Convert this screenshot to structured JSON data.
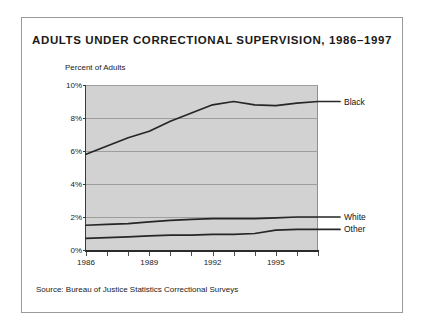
{
  "chart_data": {
    "type": "line",
    "title": "ADULTS UNDER CORRECTIONAL SUPERVISION, 1986–1997",
    "xlabel": "",
    "ylabel": "Percent of Adults",
    "ylim": [
      0,
      10
    ],
    "xlim": [
      1986,
      1997
    ],
    "grid": true,
    "legend_position": "right-inline-labels",
    "y_ticks": [
      {
        "value": 0,
        "label": "0%"
      },
      {
        "value": 2,
        "label": "2%"
      },
      {
        "value": 4,
        "label": "4%"
      },
      {
        "value": 6,
        "label": "6%"
      },
      {
        "value": 8,
        "label": "8%"
      },
      {
        "value": 10,
        "label": "10%"
      }
    ],
    "x_ticks": [
      {
        "value": 1986,
        "label": "1986"
      },
      {
        "value": 1987,
        "label": ""
      },
      {
        "value": 1988,
        "label": ""
      },
      {
        "value": 1989,
        "label": "1989"
      },
      {
        "value": 1990,
        "label": ""
      },
      {
        "value": 1991,
        "label": ""
      },
      {
        "value": 1992,
        "label": "1992"
      },
      {
        "value": 1993,
        "label": ""
      },
      {
        "value": 1994,
        "label": ""
      },
      {
        "value": 1995,
        "label": "1995"
      },
      {
        "value": 1996,
        "label": ""
      },
      {
        "value": 1997,
        "label": ""
      }
    ],
    "x": [
      1986,
      1987,
      1988,
      1989,
      1990,
      1991,
      1992,
      1993,
      1994,
      1995,
      1996,
      1997
    ],
    "series": [
      {
        "name": "Black",
        "label": "Black",
        "color": "#262626",
        "values": [
          5.8,
          6.3,
          6.8,
          7.2,
          7.8,
          8.3,
          8.8,
          9.0,
          8.8,
          8.75,
          8.9,
          9.0
        ]
      },
      {
        "name": "White",
        "label": "White",
        "color": "#262626",
        "values": [
          1.5,
          1.55,
          1.6,
          1.7,
          1.8,
          1.85,
          1.9,
          1.9,
          1.9,
          1.95,
          2.0,
          2.0
        ]
      },
      {
        "name": "Other",
        "label": "Other",
        "color": "#262626",
        "values": [
          0.7,
          0.75,
          0.8,
          0.85,
          0.9,
          0.9,
          0.95,
          0.95,
          1.0,
          1.2,
          1.25,
          1.25
        ]
      }
    ],
    "annotations": [
      {
        "name": "source-note",
        "text": "Source: Bureau of Justice Statistics Correctional Surveys"
      }
    ]
  },
  "figure": {
    "source_note": "Source: Bureau of Justice Statistics Correctional Surveys"
  }
}
